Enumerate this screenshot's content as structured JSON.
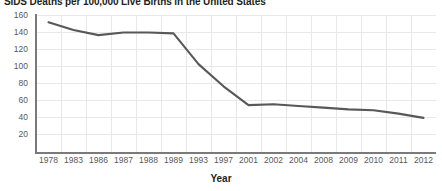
{
  "chart_data": {
    "type": "line",
    "title": "SIDS Deaths per 100,000 Live Births in the United States",
    "xlabel": "Year",
    "ylabel": "",
    "categories": [
      "1978",
      "1983",
      "1986",
      "1987",
      "1988",
      "1989",
      "1993",
      "1997",
      "2001",
      "2002",
      "2004",
      "2008",
      "2009",
      "2010",
      "2011",
      "2012"
    ],
    "values": [
      152,
      143,
      137,
      140,
      140,
      139,
      103,
      77,
      55,
      56,
      54,
      52,
      50,
      49,
      45,
      40
    ],
    "series": [
      {
        "name": "SIDS deaths per 100,000 live births",
        "values": [
          152,
          143,
          137,
          140,
          140,
          139,
          103,
          77,
          55,
          56,
          54,
          52,
          50,
          49,
          45,
          40
        ]
      }
    ],
    "ylim": [
      0,
      160
    ],
    "yticks": [
      20,
      40,
      60,
      80,
      100,
      120,
      140,
      160
    ],
    "grid": true,
    "legend": false,
    "line_color": "#58585a",
    "grid_color": "#e8e8e8",
    "axis_color": "#7a7a7a"
  },
  "chart": {
    "title": "SIDS Deaths per 100,000 Live Births in the United States",
    "x_axis_title": "Year"
  }
}
